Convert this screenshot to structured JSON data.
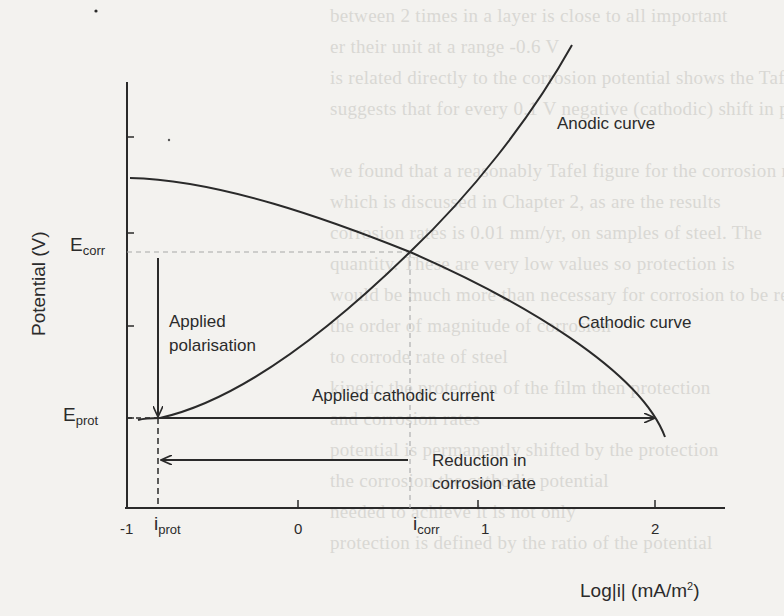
{
  "ghost_text": [
    "between 2 times in a layer is close to all important",
    "er their unit at a range -0.6 V",
    "is related directly to the corrosion potential shows the Tafel curve. This",
    "suggests that for every 0.1 V negative (cathodic) shift in potential",
    "",
    "we found that a reasonably Tafel figure for the corrosion rate",
    "which is discussed in Chapter 2, as are the results",
    "corrosion rates is 0.01 mm/yr, on samples of steel. The",
    "quantity. These are very low values so protection is",
    "would be much more than necessary for corrosion to be reduced",
    "the order of magnitude of corrosion",
    "to corrode rate of steel",
    "kinetic the protection of the film then protection",
    "and corrosion rates",
    "potential is permanently shifted by the protection",
    "the corrosion the cathodic potential",
    "needed to achieve it is not only",
    "protection is defined by the ratio of the potential"
  ],
  "diagram": {
    "y_axis_label": "Potential (V)",
    "x_axis_label_main": "Log|i| (mA/m",
    "x_axis_label_sup": "2",
    "x_axis_label_end": ")",
    "e_corr_main": "E",
    "e_corr_sub": "corr",
    "e_prot_main": "E",
    "e_prot_sub": "prot",
    "i_prot_main": "i",
    "i_prot_sub": "prot",
    "i_corr_main": "i",
    "i_corr_sub": "corr",
    "x_ticks": [
      "-1",
      "0",
      "1",
      "2"
    ],
    "anodic_label": "Anodic curve",
    "cathodic_label": "Cathodic curve",
    "applied_polarisation_line1": "Applied",
    "applied_polarisation_line2": "polarisation",
    "applied_cathodic_current": "Applied cathodic current",
    "reduction_line1": "Reduction in",
    "reduction_line2": "corrosion rate",
    "colors": {
      "ink": "#2a2a2a",
      "background": "#f3f2ef",
      "dashed": "#9a9a9a"
    }
  },
  "chart_data": {
    "type": "line",
    "xlabel": "Log|i| (mA/m2)",
    "ylabel": "Potential (V)",
    "xlim": [
      -1,
      2.4
    ],
    "x_ticks": [
      -1,
      0,
      1,
      2
    ],
    "series": [
      {
        "name": "Anodic curve",
        "x": [
          -0.82,
          -0.3,
          0.3,
          0.63,
          1.0,
          1.5
        ],
        "y_rel": [
          "E_prot",
          "",
          "",
          "E_corr",
          "",
          "top"
        ]
      },
      {
        "name": "Cathodic curve",
        "x": [
          -0.98,
          0.0,
          0.63,
          1.2,
          2.05
        ],
        "y_rel": [
          "high",
          "",
          "E_corr",
          "",
          "low"
        ]
      }
    ],
    "annotations": [
      "E_corr",
      "E_prot",
      "i_corr ≈ 0.63",
      "i_prot ≈ -0.82",
      "Applied polarisation (E_corr → E_prot)",
      "Applied cathodic current (i_prot → ~2)",
      "Reduction in corrosion rate (i_corr → i_prot)"
    ]
  }
}
